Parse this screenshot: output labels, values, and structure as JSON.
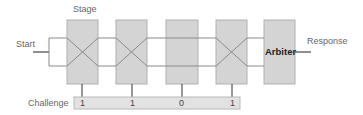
{
  "labels": {
    "stage": "Stage",
    "start": "Start",
    "response": "Response",
    "challenge": "Challenge",
    "arbiter": "Arbiter"
  },
  "stages": [
    {
      "bit": "1",
      "type": "crossed"
    },
    {
      "bit": "1",
      "type": "crossed"
    },
    {
      "bit": "0",
      "type": "straight"
    },
    {
      "bit": "1",
      "type": "crossed"
    }
  ],
  "colors": {
    "box_fill": "#d4d4d4",
    "box_stroke": "#aaaaaa",
    "wire": "#8a8a8a",
    "challenge_fill": "#e2e2e2",
    "text": "#666666"
  }
}
